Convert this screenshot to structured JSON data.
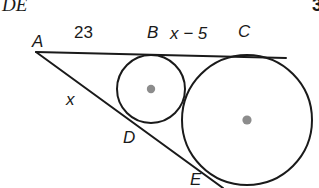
{
  "header": {
    "left_text": "DE",
    "right_text": "3"
  },
  "figure": {
    "type": "geometry-diagram",
    "stroke_color": "#1a1a1a",
    "center_dot_color": "#8c8c8c",
    "vertices": {
      "A": {
        "x": 36,
        "y": 52
      },
      "B": {
        "x": 152,
        "y": 55
      },
      "C": {
        "x": 247,
        "y": 56
      },
      "D": {
        "x": 134,
        "y": 122
      },
      "E": {
        "x": 199,
        "y": 178
      }
    },
    "circles": [
      {
        "name": "small-circle",
        "cx": 151,
        "cy": 89,
        "r": 34
      },
      {
        "name": "large-circle",
        "cx": 247,
        "cy": 120,
        "r": 65
      }
    ],
    "lines": [
      {
        "name": "upper-tangent-line",
        "x1": 36,
        "y1": 52,
        "x2": 286,
        "y2": 58
      },
      {
        "name": "lower-tangent-line",
        "x1": 36,
        "y1": 52,
        "x2": 223,
        "y2": 188
      }
    ]
  },
  "labels": {
    "A": "A",
    "B": "B",
    "C": "C",
    "D": "D",
    "E": "E",
    "seg_AB": "23",
    "seg_BC": "x − 5",
    "seg_AD": "x"
  }
}
